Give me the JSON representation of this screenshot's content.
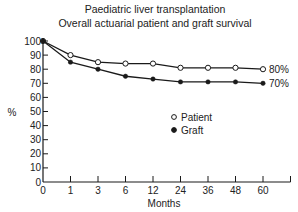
{
  "chart_data": {
    "type": "line",
    "title": "Paediatric liver transplantation",
    "subtitle": "Overall actuarial patient and graft survival",
    "xlabel": "Months",
    "ylabel": "%",
    "x": [
      "0",
      "1",
      "3",
      "6",
      "12",
      "24",
      "36",
      "48",
      "60"
    ],
    "ylim": [
      0,
      100
    ],
    "yticks": [
      0,
      10,
      20,
      30,
      40,
      50,
      60,
      70,
      80,
      90,
      100
    ],
    "grid": false,
    "legend_position": "inside, center-right",
    "series": [
      {
        "name": "Patient",
        "marker": "open-circle",
        "values": [
          100,
          90,
          85,
          84,
          84,
          81,
          81,
          81,
          80
        ],
        "end_label": "80%"
      },
      {
        "name": "Graft",
        "marker": "filled-circle",
        "values": [
          100,
          85,
          80,
          75,
          73,
          71,
          71,
          71,
          70
        ],
        "end_label": "70%"
      }
    ]
  },
  "colors": {
    "line": "#1a1a1a",
    "background": "#ffffff"
  }
}
